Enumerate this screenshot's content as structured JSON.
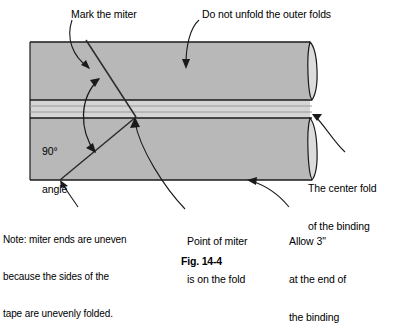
{
  "figure": {
    "caption": "Fig. 14-4",
    "colors": {
      "background": "#ffffff",
      "tape_fill": "#b8b8b8",
      "fold_strip_fill": "#d5d5d5",
      "fold_end_fill": "#dcdcdc",
      "line": "#1a1a1a",
      "text": "#000000"
    }
  },
  "labels": {
    "mark_the_miter": "Mark the miter",
    "do_not_unfold": "Do not unfold the outer folds",
    "angle_line1": "90°",
    "angle_line2": "angle",
    "center_fold_line1": "The center fold",
    "center_fold_line2": "of the binding",
    "note_line1": "Note: miter ends are uneven",
    "note_line2": "because the sides of the",
    "note_line3": "tape are unevenly folded.",
    "point_of_miter_line1": "Point of miter",
    "point_of_miter_line2": "is on the fold",
    "allow_line1": "Allow 3\"",
    "allow_line2": "at the end of",
    "allow_line3": "the binding"
  },
  "geometry": {
    "tape": {
      "left": 30,
      "right": 310,
      "top": 42,
      "bottom": 180
    },
    "fold_lines_y": [
      100,
      106,
      112,
      118
    ],
    "miter_point": {
      "x": 135,
      "y": 117
    },
    "miter_angle_degrees": 90
  }
}
